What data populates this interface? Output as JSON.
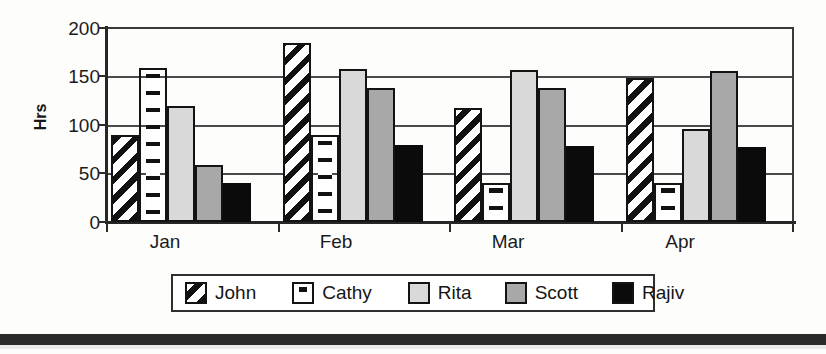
{
  "chart_data": {
    "type": "bar",
    "title": "",
    "xlabel": "",
    "ylabel": "Hrs",
    "categories": [
      "Jan",
      "Feb",
      "Mar",
      "Apr"
    ],
    "ylim": [
      0,
      200
    ],
    "yticks": [
      0,
      50,
      100,
      150,
      200
    ],
    "ytick_labels": [
      "0",
      "50",
      "100",
      "150",
      "200"
    ],
    "grid": true,
    "grid_axis": "y",
    "legend_position": "bottom",
    "series": [
      {
        "name": "John",
        "pattern": "diagonal-stripes",
        "color": "#ffffff",
        "values": [
          90,
          185,
          118,
          148
        ]
      },
      {
        "name": "Cathy",
        "pattern": "horizontal-dashes",
        "color": "#ffffff",
        "values": [
          159,
          90,
          40,
          40
        ]
      },
      {
        "name": "Rita",
        "pattern": "solid-light-gray",
        "color": "#d9d9d9",
        "values": [
          120,
          158,
          157,
          96
        ]
      },
      {
        "name": "Scott",
        "pattern": "solid-mid-gray",
        "color": "#a8a8a8",
        "values": [
          59,
          138,
          138,
          156
        ]
      },
      {
        "name": "Rajiv",
        "pattern": "solid-black",
        "color": "#0b0b0b",
        "values": [
          40,
          79,
          78,
          77
        ]
      }
    ]
  },
  "axis": {
    "y_title": "Hrs",
    "tick_labels": [
      "200",
      "150",
      "100",
      "50",
      "0"
    ],
    "category_labels": [
      "Jan",
      "Feb",
      "Mar",
      "Apr"
    ]
  },
  "legend": {
    "entries": [
      {
        "label": "John"
      },
      {
        "label": "Cathy"
      },
      {
        "label": "Rita"
      },
      {
        "label": "Scott"
      },
      {
        "label": "Rajiv"
      }
    ]
  }
}
